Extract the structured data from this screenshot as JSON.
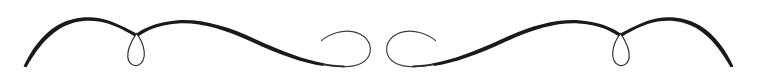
{
  "document": {
    "type": "decorative-divider",
    "title": "Ornamental Flourish Divider",
    "description": "Symmetric calligraphic flourish ornament with tapered tails, arches, teardrop loops and mirrored central spirals",
    "width": 757,
    "height": 79
  },
  "colors": {
    "background": "#ffffff",
    "ink": "#1a1a1a",
    "ink_light": "#3d3d3d",
    "ink_hairline": "#555555"
  },
  "ornament": {
    "name": "flourish-divider",
    "symmetry_axis_x": 378.5,
    "stroke_color": "#1a1a1a",
    "parts": [
      {
        "name": "left-tail",
        "label": "Left tapered tail"
      },
      {
        "name": "left-arch",
        "label": "Left arch"
      },
      {
        "name": "left-loop",
        "label": "Left teardrop loop"
      },
      {
        "name": "left-sweep",
        "label": "Left descending sweep"
      },
      {
        "name": "left-spiral",
        "label": "Left inward spiral"
      },
      {
        "name": "right-spiral",
        "label": "Right inward spiral"
      },
      {
        "name": "right-sweep",
        "label": "Right descending sweep"
      },
      {
        "name": "right-loop",
        "label": "Right teardrop loop"
      },
      {
        "name": "right-arch",
        "label": "Right arch"
      },
      {
        "name": "right-tail",
        "label": "Right tapered tail"
      }
    ]
  }
}
